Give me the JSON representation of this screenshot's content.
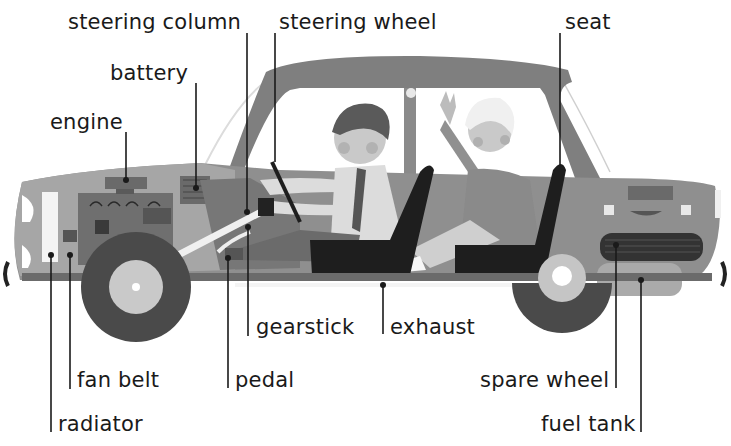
{
  "diagram": {
    "colors": {
      "background": "#ffffff",
      "body": "#8f8f8f",
      "body_light": "#a9a9a9",
      "roof": "#7f7f7f",
      "window": "#ffffff",
      "tyre": "#4a4a4a",
      "hub": "#c8c8c8",
      "seat": "#1e1e1e",
      "leader_line": "#1a1a1a",
      "text": "#1a1a1a"
    },
    "labels": [
      {
        "id": "steering-column",
        "text": "steering column"
      },
      {
        "id": "steering-wheel",
        "text": "steering wheel"
      },
      {
        "id": "seat",
        "text": "seat"
      },
      {
        "id": "battery",
        "text": "battery"
      },
      {
        "id": "engine",
        "text": "engine"
      },
      {
        "id": "gearstick",
        "text": "gearstick"
      },
      {
        "id": "exhaust",
        "text": "exhaust"
      },
      {
        "id": "fan-belt",
        "text": "fan belt"
      },
      {
        "id": "pedal",
        "text": "pedal"
      },
      {
        "id": "spare-wheel",
        "text": "spare wheel"
      },
      {
        "id": "radiator",
        "text": "radiator"
      },
      {
        "id": "fuel-tank",
        "text": "fuel tank"
      }
    ]
  }
}
